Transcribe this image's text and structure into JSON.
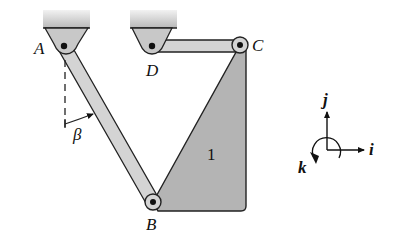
{
  "diagram": {
    "points": {
      "A": {
        "label": "A"
      },
      "B": {
        "label": "B"
      },
      "C": {
        "label": "C"
      },
      "D": {
        "label": "D"
      }
    },
    "body_label": "1",
    "angle_label": "β",
    "axes": {
      "i": "i",
      "j": "j",
      "k": "k"
    },
    "colors": {
      "ground": "#c8c8c8",
      "bar": "#d4d4d4",
      "plate": "#b4b4b4",
      "stroke": "#222222"
    }
  }
}
